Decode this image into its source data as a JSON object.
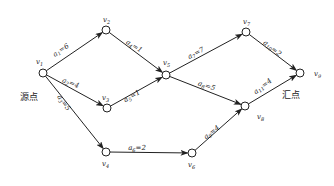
{
  "diagram": {
    "type": "AOE network",
    "source_label": "源点",
    "sink_label": "汇点",
    "nodes": [
      {
        "id": "v1",
        "label": "v1",
        "x": 43,
        "y": 73,
        "lx": 36,
        "ly": 64
      },
      {
        "id": "v2",
        "label": "v2",
        "x": 106,
        "y": 30,
        "lx": 103,
        "ly": 22
      },
      {
        "id": "v3",
        "label": "v3",
        "x": 107,
        "y": 108,
        "lx": 102,
        "ly": 100
      },
      {
        "id": "v4",
        "label": "v4",
        "x": 106,
        "y": 152,
        "lx": 102,
        "ly": 166
      },
      {
        "id": "v5",
        "label": "v5",
        "x": 166,
        "y": 75,
        "lx": 163,
        "ly": 65
      },
      {
        "id": "v6",
        "label": "v6",
        "x": 192,
        "y": 153,
        "lx": 188,
        "ly": 167
      },
      {
        "id": "v7",
        "label": "v7",
        "x": 246,
        "y": 32,
        "lx": 243,
        "ly": 24
      },
      {
        "id": "v8",
        "label": "v8",
        "x": 245,
        "y": 106,
        "lx": 257,
        "ly": 119
      },
      {
        "id": "v9",
        "label": "v9",
        "x": 300,
        "y": 73,
        "lx": 314,
        "ly": 76
      }
    ],
    "edges": [
      {
        "from": "v1",
        "to": "v2",
        "label": "a1=6",
        "lx": 62,
        "ly": 52,
        "rot": -34
      },
      {
        "from": "v1",
        "to": "v3",
        "label": "a2=4",
        "lx": 70,
        "ly": 85,
        "rot": 20
      },
      {
        "from": "v1",
        "to": "v4",
        "label": "a3=5",
        "lx": 62,
        "ly": 104,
        "rot": 55
      },
      {
        "from": "v2",
        "to": "v5",
        "label": "a4=1",
        "lx": 133,
        "ly": 48,
        "rot": 32
      },
      {
        "from": "v3",
        "to": "v5",
        "label": "a5=1",
        "lx": 133,
        "ly": 98,
        "rot": -30
      },
      {
        "from": "v4",
        "to": "v6",
        "label": "a6=2",
        "lx": 137,
        "ly": 150,
        "rot": 0
      },
      {
        "from": "v5",
        "to": "v7",
        "label": "a7=7",
        "lx": 197,
        "ly": 55,
        "rot": -28
      },
      {
        "from": "v5",
        "to": "v8",
        "label": "a8=5",
        "lx": 206,
        "ly": 88,
        "rot": 18
      },
      {
        "from": "v6",
        "to": "v8",
        "label": "a9=4",
        "lx": 213,
        "ly": 134,
        "rot": -38
      },
      {
        "from": "v7",
        "to": "v9",
        "label": "a10=2",
        "lx": 271,
        "ly": 50,
        "rot": 38
      },
      {
        "from": "v8",
        "to": "v9",
        "label": "a11=4",
        "lx": 264,
        "ly": 88,
        "rot": -38
      }
    ],
    "source_pos": {
      "x": 20,
      "y": 100
    },
    "sink_pos": {
      "x": 282,
      "y": 98
    }
  }
}
